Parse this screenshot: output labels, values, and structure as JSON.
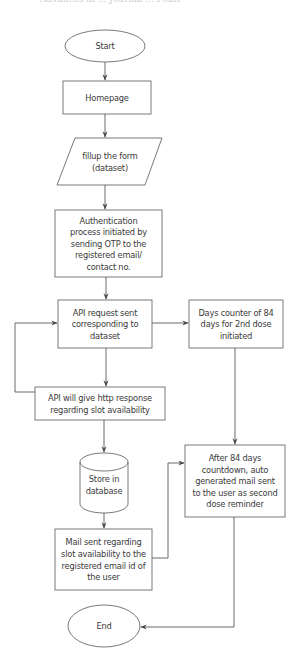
{
  "header": {
    "cut_off_title": "Advances in ... Journal ... Point"
  },
  "colors": {
    "stroke": "#5a5a5a",
    "text": "#3a3a3a",
    "background": "#ffffff"
  },
  "flowchart": {
    "nodes": {
      "start": {
        "shape": "ellipse",
        "label": "Start"
      },
      "homepage": {
        "shape": "rectangle",
        "label": "Homepage"
      },
      "fillup_form": {
        "shape": "parallelogram",
        "label": "fillup the form\n(dataset)"
      },
      "authentication": {
        "shape": "rectangle",
        "label": "Authentication\nprocess initiated by\nsending OTP to the\nregistered email/\ncontact no."
      },
      "api_request": {
        "shape": "rectangle",
        "label": "API request sent\ncorresponding to\ndataset"
      },
      "days_counter": {
        "shape": "rectangle",
        "label": "Days counter of 84\ndays for 2nd dose\ninitiated"
      },
      "api_response": {
        "shape": "rectangle",
        "label": "API will give http response\nregarding slot availability"
      },
      "store_db": {
        "shape": "cylinder",
        "label": "Store in\ndatabase"
      },
      "after_84_days": {
        "shape": "rectangle",
        "label": "After 84 days\ncountdown, auto\ngenerated mail sent\nto the user as second\ndose reminder"
      },
      "mail_sent": {
        "shape": "rectangle",
        "label": "Mail sent regarding\nslot availability to the\nregistered email id of\nthe user"
      },
      "end": {
        "shape": "ellipse",
        "label": "End"
      }
    },
    "edges": [
      {
        "from": "Start",
        "to": "Homepage"
      },
      {
        "from": "Homepage",
        "to": "fillup the form (dataset)"
      },
      {
        "from": "fillup the form (dataset)",
        "to": "Authentication process"
      },
      {
        "from": "Authentication process",
        "to": "API request sent"
      },
      {
        "from": "API request sent",
        "to": "Days counter of 84 days"
      },
      {
        "from": "API request sent",
        "to": "API will give http response"
      },
      {
        "from": "API will give http response",
        "to": "API request sent",
        "type": "loop-back"
      },
      {
        "from": "API will give http response",
        "to": "Store in database"
      },
      {
        "from": "Store in database",
        "to": "Mail sent regarding slot availability"
      },
      {
        "from": "Mail sent regarding slot availability",
        "to": "After 84 days countdown"
      },
      {
        "from": "Days counter of 84 days",
        "to": "After 84 days countdown"
      },
      {
        "from": "After 84 days countdown",
        "to": "End"
      }
    ]
  }
}
